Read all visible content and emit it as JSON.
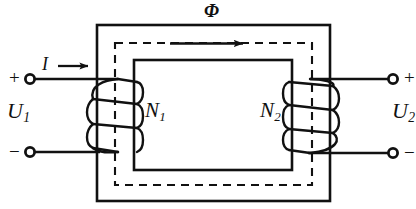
{
  "figure": {
    "kind": "transformer-schematic",
    "width": 416,
    "height": 209,
    "background": "#ffffff",
    "line_color": "#111111"
  },
  "labels": {
    "flux": "Φ",
    "current": "I",
    "primary_turns": {
      "base": "N",
      "sub": "1"
    },
    "secondary_turns": {
      "base": "N",
      "sub": "2"
    },
    "primary_voltage": {
      "base": "U",
      "sub": "1"
    },
    "secondary_voltage": {
      "base": "U",
      "sub": "2"
    }
  },
  "terminals": {
    "primary_positive": "+",
    "primary_negative": "−",
    "secondary_positive": "+",
    "secondary_negative": "−"
  },
  "icons": {
    "current_arrow": "current-direction-arrow-icon",
    "flux_arrow": "flux-direction-arrow-icon",
    "terminal_node": "terminal-node-icon"
  },
  "colors": {
    "stroke": "#111111",
    "paper": "#ffffff"
  },
  "geometry": {
    "core_outer": {
      "x": 97,
      "y": 25,
      "width": 233,
      "height": 176
    },
    "core_inner": {
      "x": 134,
      "y": 60,
      "width": 158,
      "height": 110
    },
    "flux_path": {
      "x": 115,
      "y": 43,
      "width": 197,
      "height": 142
    },
    "primary_lead_top_y": 79,
    "primary_lead_bottom_y": 152,
    "secondary_lead_top_y": 79,
    "secondary_lead_bottom_y": 153
  }
}
